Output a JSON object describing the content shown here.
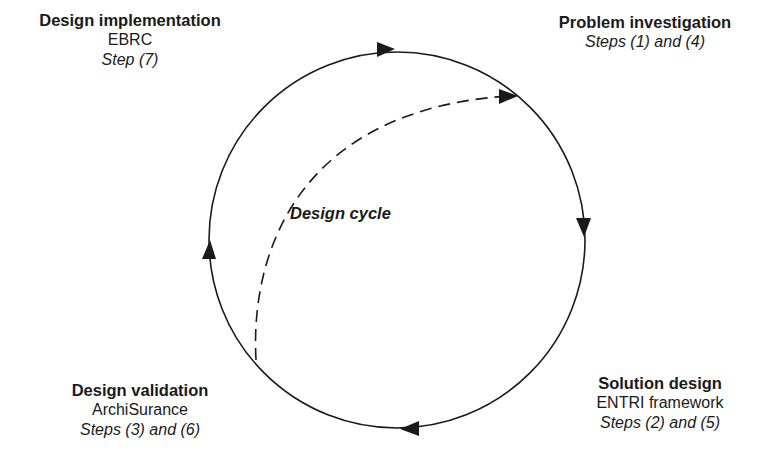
{
  "diagram": {
    "center_label": "Design cycle",
    "phases": [
      {
        "id": "problem-investigation",
        "title": "Problem investigation",
        "artifact": "",
        "steps": "Steps (1) and (4)"
      },
      {
        "id": "solution-design",
        "title": "Solution design",
        "artifact": "ENTRI framework",
        "steps": "Steps (2) and (5)"
      },
      {
        "id": "design-validation",
        "title": "Design validation",
        "artifact": "ArchiSurance",
        "steps": "Steps (3) and (6)"
      },
      {
        "id": "design-implementation",
        "title": "Design implementation",
        "artifact": "EBRC",
        "steps": "Step (7)"
      }
    ],
    "colors": {
      "line": "#1a1a1a",
      "background": "#ffffff"
    }
  }
}
